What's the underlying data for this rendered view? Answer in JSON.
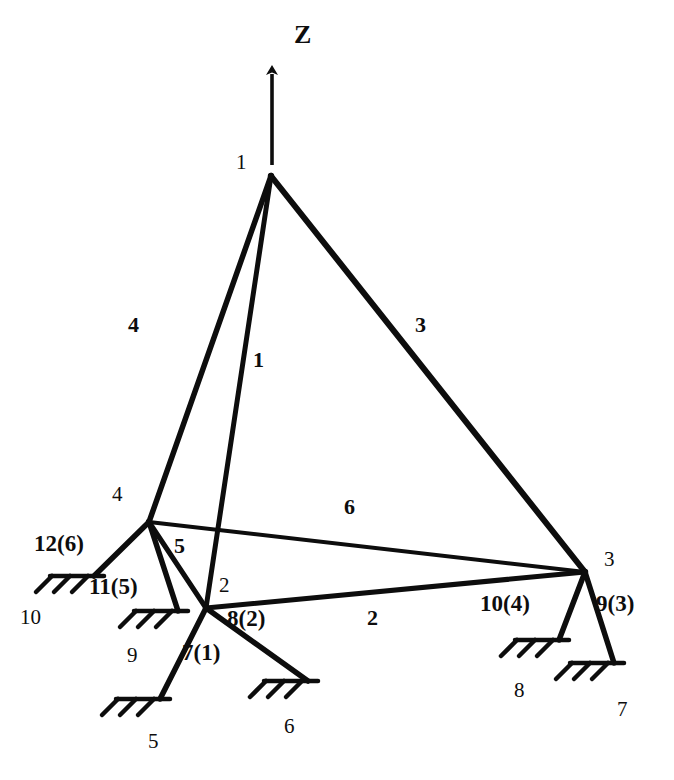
{
  "figure": {
    "type": "structural-truss-diagram",
    "background_color": "#ffffff",
    "ink_color": "#0d0d0d",
    "width": 674,
    "height": 780
  },
  "axis": {
    "label": "Z",
    "label_x": 294,
    "label_y": 22,
    "arrow_tail_x": 272,
    "arrow_tail_y": 165,
    "arrow_head_x": 272,
    "arrow_head_y": 62
  },
  "joints": [
    {
      "id": "1",
      "label": "1",
      "x": 271,
      "y": 176,
      "label_x": 236,
      "label_y": 152
    },
    {
      "id": "2",
      "label": "2",
      "x": 206,
      "y": 608,
      "label_x": 219,
      "label_y": 575
    },
    {
      "id": "3",
      "label": "3",
      "x": 585,
      "y": 572,
      "label_x": 604,
      "label_y": 549
    },
    {
      "id": "4",
      "label": "4",
      "x": 149,
      "y": 522,
      "label_x": 112,
      "label_y": 484
    }
  ],
  "members": [
    {
      "id": "1",
      "label": "1",
      "from": "1",
      "to": "2",
      "label_x": 253,
      "label_y": 349,
      "width": 5
    },
    {
      "id": "2",
      "label": "2",
      "from": "2",
      "to": "3",
      "label_x": 367,
      "label_y": 607,
      "width": 5
    },
    {
      "id": "3",
      "label": "3",
      "from": "1",
      "to": "3",
      "label_x": 415,
      "label_y": 314,
      "width": 6
    },
    {
      "id": "4",
      "label": "4",
      "from": "1",
      "to": "4",
      "label_x": 128,
      "label_y": 314,
      "width": 5.5
    },
    {
      "id": "5",
      "label": "5",
      "from": "4",
      "to": "2",
      "label_x": 174,
      "label_y": 535,
      "width": 5
    },
    {
      "id": "6",
      "label": "6",
      "from": "4",
      "to": "3",
      "label_x": 344,
      "label_y": 496,
      "width": 4
    }
  ],
  "supports": [
    {
      "id": "7",
      "label": "7(1)",
      "joint": "2",
      "ground_x": 160,
      "ground_y": 699,
      "ground_angle_deg": 0,
      "label_x": 182,
      "label_y": 641,
      "node_label": "5",
      "node_label_x": 148,
      "node_label_y": 731
    },
    {
      "id": "8",
      "label": "8(2)",
      "joint": "2",
      "ground_x": 308,
      "ground_y": 681,
      "ground_angle_deg": 0,
      "label_x": 227,
      "label_y": 607,
      "node_label": "6",
      "node_label_x": 284,
      "node_label_y": 716
    },
    {
      "id": "9",
      "label": "9(3)",
      "joint": "3",
      "ground_x": 614,
      "ground_y": 663,
      "ground_angle_deg": 0,
      "label_x": 596,
      "label_y": 592,
      "node_label": "7",
      "node_label_x": 617,
      "node_label_y": 699
    },
    {
      "id": "10",
      "label": "10(4)",
      "joint": "3",
      "ground_x": 559,
      "ground_y": 640,
      "ground_angle_deg": 0,
      "label_x": 480,
      "label_y": 592,
      "node_label": "8",
      "node_label_x": 514,
      "node_label_y": 680
    },
    {
      "id": "11",
      "label": "11(5)",
      "joint": "4",
      "ground_x": 178,
      "ground_y": 611,
      "ground_angle_deg": 0,
      "label_x": 89,
      "label_y": 575,
      "node_label": "9",
      "node_label_x": 127,
      "node_label_y": 645
    },
    {
      "id": "12",
      "label": "12(6)",
      "joint": "4",
      "ground_x": 94,
      "ground_y": 576,
      "ground_angle_deg": 0,
      "label_x": 34,
      "label_y": 532,
      "node_label": "10",
      "node_label_x": 20,
      "node_label_y": 607
    }
  ]
}
